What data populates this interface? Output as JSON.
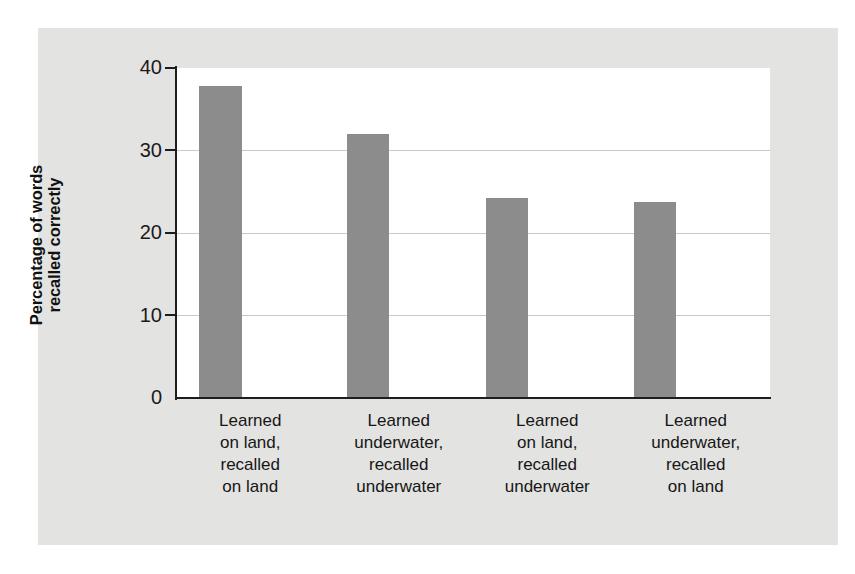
{
  "chart_data": {
    "type": "bar",
    "title": "",
    "xlabel": "",
    "ylabel": "Percentage of words recalled correctly",
    "ylabel_lines": [
      "Percentage of words",
      "recalled correctly"
    ],
    "categories": [
      "Learned on land, recalled on land",
      "Learned underwater, recalled underwater",
      "Learned on land, recalled underwater",
      "Learned underwater, recalled on land"
    ],
    "category_lines": [
      [
        "Learned",
        "on land,",
        "recalled",
        "on land"
      ],
      [
        "Learned",
        "underwater,",
        "recalled",
        "underwater"
      ],
      [
        "Learned",
        "on land,",
        "recalled",
        "underwater"
      ],
      [
        "Learned",
        "underwater,",
        "recalled",
        "on land"
      ]
    ],
    "values": [
      37.8,
      32.0,
      24.3,
      23.8
    ],
    "ylim": [
      0,
      40
    ],
    "yticks": [
      0,
      10,
      20,
      30,
      40
    ],
    "ytick_labels": [
      "0",
      "10",
      "20",
      "30",
      "40"
    ],
    "grid": true,
    "legend": false,
    "bar_color": "#8c8c8c",
    "panel_color": "#e3e3e1",
    "plot_bg_color": "#ffffff",
    "axis_color": "#1d1d1d",
    "gridline_color": "#c9c9c9"
  }
}
